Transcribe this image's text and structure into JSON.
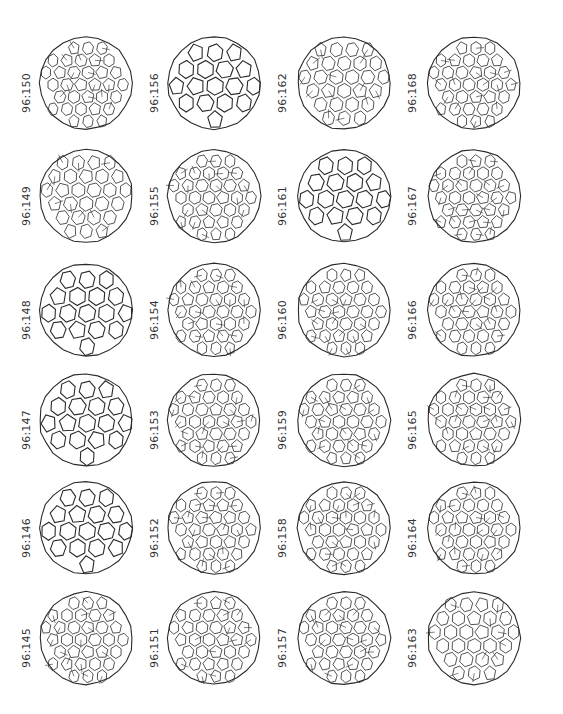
{
  "figure": {
    "layout": {
      "columns": 4,
      "rows": 6
    },
    "columns": [
      {
        "cells": [
          {
            "label": "96:150",
            "style": "dense"
          },
          {
            "label": "96:149",
            "style": "symmetric"
          },
          {
            "label": "96:148",
            "style": "simple"
          },
          {
            "label": "96:147",
            "style": "simple"
          },
          {
            "label": "96:146",
            "style": "simple"
          },
          {
            "label": "96:145",
            "style": "dense"
          }
        ]
      },
      {
        "cells": [
          {
            "label": "96:156",
            "style": "simple"
          },
          {
            "label": "96:155",
            "style": "dense"
          },
          {
            "label": "96:154",
            "style": "dense"
          },
          {
            "label": "96:153",
            "style": "dense"
          },
          {
            "label": "96:152",
            "style": "dense"
          },
          {
            "label": "96:151",
            "style": "dense"
          }
        ]
      },
      {
        "cells": [
          {
            "label": "96:162",
            "style": "symmetric"
          },
          {
            "label": "96:161",
            "style": "simple"
          },
          {
            "label": "96:160",
            "style": "dense"
          },
          {
            "label": "96:159",
            "style": "dense"
          },
          {
            "label": "96:158",
            "style": "dense"
          },
          {
            "label": "96:157",
            "style": "dense"
          }
        ]
      },
      {
        "cells": [
          {
            "label": "96:168",
            "style": "dense"
          },
          {
            "label": "96:167",
            "style": "dense"
          },
          {
            "label": "96:166",
            "style": "dense"
          },
          {
            "label": "96:165",
            "style": "dense"
          },
          {
            "label": "96:164",
            "style": "dense"
          },
          {
            "label": "96:163",
            "style": "symmetric"
          }
        ]
      }
    ],
    "colors": {
      "line": "#2a2a2a",
      "label": "#333333",
      "background": "#ffffff"
    }
  }
}
